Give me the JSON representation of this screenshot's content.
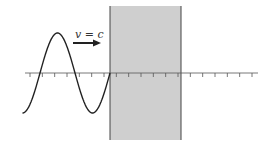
{
  "diagram": {
    "velocity_label": "v = c",
    "colors": {
      "medium_fill": "#cfcfcf",
      "medium_edge": "#444444",
      "wave": "#222222",
      "axis": "#555555",
      "arrow": "#222222"
    },
    "wave": {
      "cycles_shown": 1.25,
      "direction": "right"
    },
    "axis": {
      "tick_count": 19
    }
  }
}
